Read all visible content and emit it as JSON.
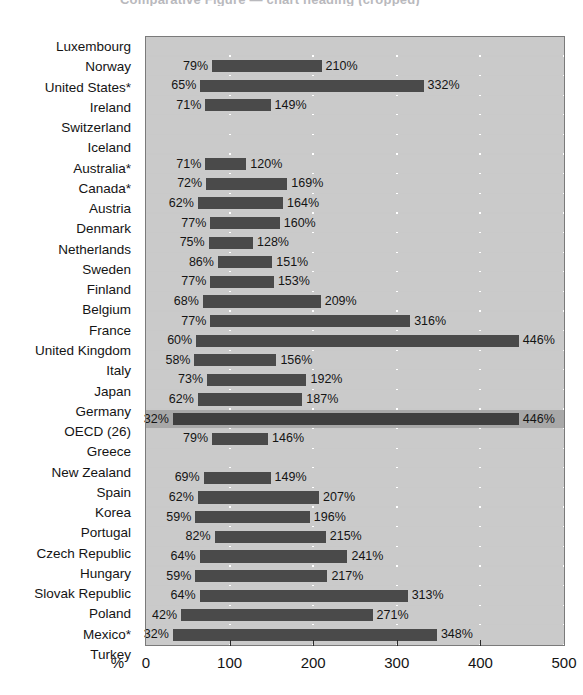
{
  "title_fragment": "Comparative  Figure  — chart  heading  (cropped)",
  "axis": {
    "unit_symbol": "%",
    "ticks": [
      0,
      100,
      200,
      300,
      400,
      500
    ],
    "tick_labels": [
      "0",
      "100",
      "200",
      "300",
      "400",
      "500"
    ],
    "min": 0,
    "max": 500
  },
  "colors": {
    "plot_background": "#c9c9c9",
    "row_background": "#cacaca",
    "row_highlight_background": "#a8a8a8",
    "bar": "#4a4a4a",
    "gridline": "#ffffff",
    "text": "#141414",
    "frame": "#7a7a7a"
  },
  "chart_data": {
    "type": "bar",
    "orientation": "horizontal",
    "title": "",
    "xlabel": "%",
    "ylabel": "",
    "xlim": [
      0,
      500
    ],
    "grid": true,
    "legend": "none",
    "note": "Each row is a floating (range) bar drawn from a start value to an end value; both endpoints are labelled.",
    "categories": [
      "Luxembourg",
      "Norway",
      "United States*",
      "Ireland",
      "Switzerland",
      "Iceland",
      "Australia*",
      "Canada*",
      "Austria",
      "Denmark",
      "Netherlands",
      "Sweden",
      "Finland",
      "Belgium",
      "France",
      "United Kingdom",
      "Italy",
      "Japan",
      "Germany",
      "OECD (26)",
      "Greece",
      "New Zealand",
      "Spain",
      "Korea",
      "Portugal",
      "Czech Republic",
      "Hungary",
      "Slovak Republic",
      "Poland",
      "Mexico*",
      "Turkey"
    ],
    "rows": [
      {
        "category": "Luxembourg",
        "start": null,
        "end": null,
        "start_label": "",
        "end_label": "",
        "highlight": false
      },
      {
        "category": "Norway",
        "start": 79,
        "end": 210,
        "start_label": "79%",
        "end_label": "210%",
        "highlight": false
      },
      {
        "category": "United States*",
        "start": 65,
        "end": 332,
        "start_label": "65%",
        "end_label": "332%",
        "highlight": false
      },
      {
        "category": "Ireland",
        "start": 71,
        "end": 149,
        "start_label": "71%",
        "end_label": "149%",
        "highlight": false
      },
      {
        "category": "Switzerland",
        "start": null,
        "end": null,
        "start_label": "",
        "end_label": "",
        "highlight": false
      },
      {
        "category": "Iceland",
        "start": null,
        "end": null,
        "start_label": "",
        "end_label": "",
        "highlight": false
      },
      {
        "category": "Australia*",
        "start": 71,
        "end": 120,
        "start_label": "71%",
        "end_label": "120%",
        "highlight": false
      },
      {
        "category": "Canada*",
        "start": 72,
        "end": 169,
        "start_label": "72%",
        "end_label": "169%",
        "highlight": false
      },
      {
        "category": "Austria",
        "start": 62,
        "end": 164,
        "start_label": "62%",
        "end_label": "164%",
        "highlight": false
      },
      {
        "category": "Denmark",
        "start": 77,
        "end": 160,
        "start_label": "77%",
        "end_label": "160%",
        "highlight": false
      },
      {
        "category": "Netherlands",
        "start": 75,
        "end": 128,
        "start_label": "75%",
        "end_label": "128%",
        "highlight": false
      },
      {
        "category": "Sweden",
        "start": 86,
        "end": 151,
        "start_label": "86%",
        "end_label": "151%",
        "highlight": false
      },
      {
        "category": "Finland",
        "start": 77,
        "end": 153,
        "start_label": "77%",
        "end_label": "153%",
        "highlight": false
      },
      {
        "category": "Belgium",
        "start": 68,
        "end": 209,
        "start_label": "68%",
        "end_label": "209%",
        "highlight": false
      },
      {
        "category": "France",
        "start": 77,
        "end": 316,
        "start_label": "77%",
        "end_label": "316%",
        "highlight": false
      },
      {
        "category": "United Kingdom",
        "start": 60,
        "end": 446,
        "start_label": "60%",
        "end_label": "446%",
        "highlight": false
      },
      {
        "category": "Italy",
        "start": 58,
        "end": 156,
        "start_label": "58%",
        "end_label": "156%",
        "highlight": false
      },
      {
        "category": "Japan",
        "start": 73,
        "end": 192,
        "start_label": "73%",
        "end_label": "192%",
        "highlight": false
      },
      {
        "category": "Germany",
        "start": 62,
        "end": 187,
        "start_label": "62%",
        "end_label": "187%",
        "highlight": false
      },
      {
        "category": "OECD (26)",
        "start": 32,
        "end": 446,
        "start_label": "32%",
        "end_label": "446%",
        "highlight": true
      },
      {
        "category": "Greece",
        "start": 79,
        "end": 146,
        "start_label": "79%",
        "end_label": "146%",
        "highlight": false
      },
      {
        "category": "New Zealand",
        "start": null,
        "end": null,
        "start_label": "",
        "end_label": "",
        "highlight": false
      },
      {
        "category": "Spain",
        "start": 69,
        "end": 149,
        "start_label": "69%",
        "end_label": "149%",
        "highlight": false
      },
      {
        "category": "Korea",
        "start": 62,
        "end": 207,
        "start_label": "62%",
        "end_label": "207%",
        "highlight": false
      },
      {
        "category": "Portugal",
        "start": 59,
        "end": 196,
        "start_label": "59%",
        "end_label": "196%",
        "highlight": false
      },
      {
        "category": "Czech Republic",
        "start": 82,
        "end": 215,
        "start_label": "82%",
        "end_label": "215%",
        "highlight": false
      },
      {
        "category": "Hungary",
        "start": 64,
        "end": 241,
        "start_label": "64%",
        "end_label": "241%",
        "highlight": false
      },
      {
        "category": "Slovak Republic",
        "start": 59,
        "end": 217,
        "start_label": "59%",
        "end_label": "217%",
        "highlight": false
      },
      {
        "category": "Poland",
        "start": 64,
        "end": 313,
        "start_label": "64%",
        "end_label": "313%",
        "highlight": false
      },
      {
        "category": "Mexico*",
        "start": 42,
        "end": 271,
        "start_label": "42%",
        "end_label": "271%",
        "highlight": false
      },
      {
        "category": "Turkey",
        "start": 32,
        "end": 348,
        "start_label": "32%",
        "end_label": "348%",
        "highlight": false
      }
    ]
  }
}
